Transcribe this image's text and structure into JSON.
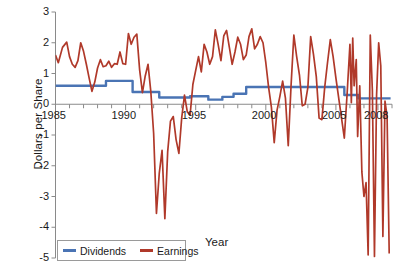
{
  "chart_data": {
    "type": "line",
    "title": "",
    "xlabel": "Year",
    "ylabel": "Dollars per Share",
    "xlim": [
      1985,
      2009
    ],
    "ylim": [
      -5,
      3
    ],
    "grid": false,
    "legend_position": "bottom-left",
    "y_ticks": [
      "3",
      "2",
      "1",
      "0",
      "-1",
      "-2",
      "-3",
      "-4",
      "-5"
    ],
    "y_tick_values": [
      3,
      2,
      1,
      0,
      -1,
      -2,
      -3,
      -4,
      -5
    ],
    "x_ticks": [
      "1985",
      "1990",
      "1995",
      "2000",
      "2005",
      "2008"
    ],
    "x_tick_values": [
      1985,
      1990,
      1995,
      2000,
      2005,
      2008
    ],
    "x_minor_tick_interval": 1,
    "series": [
      {
        "name": "Dividends",
        "color": "#4a74b4",
        "style": "step",
        "x": [
          1985.0,
          1988.6,
          1988.6,
          1990.5,
          1990.5,
          1991.0,
          1991.0,
          1992.4,
          1992.4,
          1994.6,
          1994.6,
          1995.9,
          1995.9,
          1996.9,
          1996.9,
          1997.7,
          1997.7,
          1998.6,
          1998.6,
          2005.6,
          2005.6,
          2006.6,
          2006.6,
          2008.9
        ],
        "y": [
          0.6,
          0.6,
          0.76,
          0.76,
          0.4,
          0.4,
          0.4,
          0.4,
          0.22,
          0.22,
          0.26,
          0.26,
          0.15,
          0.15,
          0.24,
          0.24,
          0.34,
          0.34,
          0.56,
          0.56,
          0.3,
          0.3,
          0.19,
          0.19
        ]
      },
      {
        "name": "Earnings",
        "color": "#b0392a",
        "style": "line",
        "x": [
          1985.0,
          1985.2,
          1985.5,
          1985.8,
          1986.0,
          1986.2,
          1986.4,
          1986.6,
          1986.8,
          1987.0,
          1987.2,
          1987.4,
          1987.6,
          1987.8,
          1988.0,
          1988.2,
          1988.4,
          1988.6,
          1988.8,
          1989.0,
          1989.2,
          1989.4,
          1989.6,
          1989.8,
          1990.0,
          1990.2,
          1990.4,
          1990.6,
          1990.8,
          1991.0,
          1991.2,
          1991.4,
          1991.6,
          1991.8,
          1992.0,
          1992.2,
          1992.4,
          1992.6,
          1992.8,
          1993.0,
          1993.2,
          1993.4,
          1993.6,
          1993.8,
          1994.0,
          1994.2,
          1994.4,
          1994.6,
          1994.8,
          1995.0,
          1995.2,
          1995.4,
          1995.6,
          1995.8,
          1996.0,
          1996.2,
          1996.4,
          1996.6,
          1996.8,
          1997.0,
          1997.2,
          1997.4,
          1997.6,
          1997.8,
          1998.0,
          1998.2,
          1998.4,
          1998.6,
          1998.8,
          1999.0,
          1999.2,
          1999.4,
          1999.6,
          1999.8,
          2000.0,
          2000.2,
          2000.4,
          2000.6,
          2000.8,
          2001.0,
          2001.2,
          2001.4,
          2001.6,
          2001.8,
          2002.0,
          2002.2,
          2002.4,
          2002.6,
          2002.8,
          2003.0,
          2003.2,
          2003.4,
          2003.6,
          2003.8,
          2004.0,
          2004.2,
          2004.4,
          2004.6,
          2004.8,
          2005.0,
          2005.2,
          2005.4,
          2005.6,
          2005.8,
          2006.0,
          2006.1,
          2006.2,
          2006.3,
          2006.45,
          2006.55,
          2006.7,
          2006.85,
          2007.0,
          2007.15,
          2007.3,
          2007.45,
          2007.6,
          2007.75,
          2007.9,
          2008.05,
          2008.2,
          2008.35,
          2008.5,
          2008.65,
          2008.8
        ],
        "y": [
          1.6,
          1.35,
          1.85,
          2.02,
          1.55,
          1.3,
          1.2,
          1.42,
          2.0,
          1.72,
          1.3,
          0.85,
          0.42,
          0.72,
          1.18,
          1.45,
          1.22,
          1.25,
          1.4,
          1.2,
          1.32,
          1.3,
          1.7,
          1.32,
          1.3,
          2.3,
          1.95,
          2.18,
          2.28,
          1.12,
          0.38,
          0.92,
          1.3,
          0.4,
          -0.95,
          -3.55,
          -2.25,
          -1.5,
          -3.72,
          -1.55,
          -0.55,
          -0.4,
          -1.15,
          -1.6,
          -0.45,
          0.3,
          -0.25,
          -0.35,
          0.65,
          1.1,
          1.55,
          1.05,
          1.95,
          1.7,
          1.3,
          1.55,
          2.42,
          1.95,
          1.42,
          2.22,
          2.4,
          1.85,
          1.3,
          1.7,
          2.18,
          1.95,
          1.45,
          1.6,
          2.2,
          2.45,
          1.8,
          1.95,
          2.2,
          2.0,
          1.35,
          0.55,
          -0.1,
          -1.25,
          -0.2,
          0.25,
          0.75,
          0.2,
          -1.35,
          0.6,
          2.25,
          1.55,
          0.95,
          -0.05,
          0.0,
          0.55,
          2.2,
          1.62,
          0.9,
          -0.45,
          -0.5,
          0.55,
          1.35,
          2.1,
          1.55,
          0.85,
          0.2,
          -0.45,
          -1.1,
          0.35,
          1.95,
          0.05,
          2.15,
          0.6,
          1.45,
          -1.05,
          0.6,
          -2.2,
          -3.0,
          -2.55,
          -4.9,
          2.25,
          0.45,
          -4.95,
          0.3,
          2.0,
          1.25,
          -4.3,
          0.1,
          -0.4,
          -4.85
        ]
      }
    ]
  },
  "legend": {
    "items": [
      {
        "label": "Dividends",
        "color": "#4a74b4"
      },
      {
        "label": "Earnings",
        "color": "#b0392a"
      }
    ]
  },
  "axes": {
    "x_title": "Year",
    "y_title": "Dollars per Share",
    "axis_color": "#8a8a8a"
  }
}
